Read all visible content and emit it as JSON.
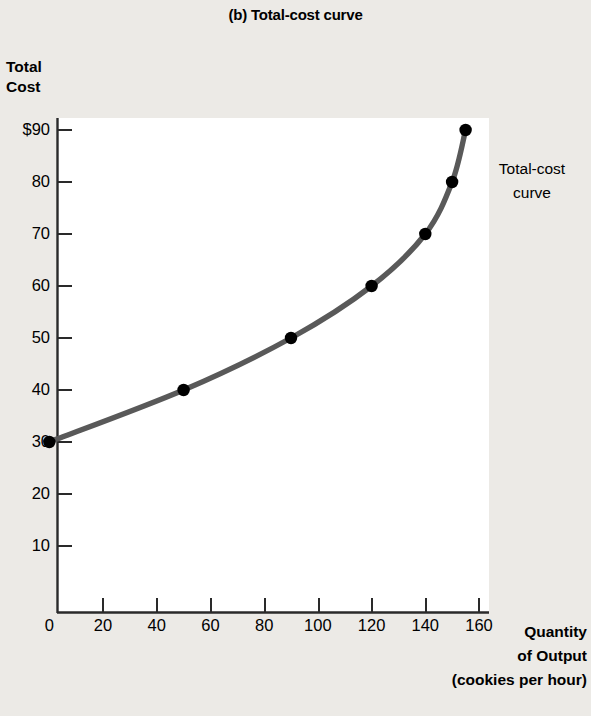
{
  "figure": {
    "panel_label": "(b)",
    "title": "(b) Total-cost curve",
    "background_color": "#eceae6",
    "plot_background_color": "#ffffff"
  },
  "chart_data": {
    "type": "line",
    "title": "(b) Total-cost curve",
    "xlabel": "Quantity of Output (cookies per hour)",
    "ylabel": "Total Cost",
    "xlim": [
      0,
      170
    ],
    "ylim": [
      0,
      93
    ],
    "grid": false,
    "legend": "none",
    "series": [
      {
        "name": "Total-cost curve",
        "color": "#595959",
        "marker": "circle",
        "marker_color": "#000000",
        "points": [
          {
            "x": 0,
            "y": 30
          },
          {
            "x": 50,
            "y": 40
          },
          {
            "x": 90,
            "y": 50
          },
          {
            "x": 120,
            "y": 60
          },
          {
            "x": 140,
            "y": 70
          },
          {
            "x": 150,
            "y": 80
          },
          {
            "x": 155,
            "y": 90
          }
        ],
        "x": [
          0,
          50,
          90,
          120,
          140,
          150,
          155
        ],
        "values": [
          30,
          40,
          50,
          60,
          70,
          80,
          90
        ]
      }
    ],
    "annotations": [
      {
        "text": "Total-cost curve",
        "x": 168,
        "y": 83
      }
    ],
    "xticks": [
      0,
      20,
      40,
      60,
      80,
      100,
      120,
      140,
      160
    ],
    "xtick_labels": [
      "0",
      "20",
      "40",
      "60",
      "80",
      "100",
      "120",
      "140",
      "160"
    ],
    "yticks": [
      10,
      20,
      30,
      40,
      50,
      60,
      70,
      80,
      90
    ],
    "ytick_labels": [
      "10",
      "20",
      "30",
      "40",
      "50",
      "60",
      "70",
      "80",
      "$90"
    ]
  },
  "y_axis": {
    "title_line1": "Total",
    "title_line2": "Cost",
    "ticks": [
      {
        "value": 90,
        "label": "$90"
      },
      {
        "value": 80,
        "label": "80"
      },
      {
        "value": 70,
        "label": "70"
      },
      {
        "value": 60,
        "label": "60"
      },
      {
        "value": 50,
        "label": "50"
      },
      {
        "value": 40,
        "label": "40"
      },
      {
        "value": 30,
        "label": "30"
      },
      {
        "value": 20,
        "label": "20"
      },
      {
        "value": 10,
        "label": "10"
      }
    ]
  },
  "x_axis": {
    "title_line1": "Quantity",
    "title_line2": "of Output",
    "title_line3": "(cookies per hour)",
    "ticks": [
      {
        "value": 0,
        "label": "0"
      },
      {
        "value": 20,
        "label": "20"
      },
      {
        "value": 40,
        "label": "40"
      },
      {
        "value": 60,
        "label": "60"
      },
      {
        "value": 80,
        "label": "80"
      },
      {
        "value": 100,
        "label": "100"
      },
      {
        "value": 120,
        "label": "120"
      },
      {
        "value": 140,
        "label": "140"
      },
      {
        "value": 160,
        "label": "160"
      }
    ]
  },
  "curve_annotation": {
    "line1": "Total-cost",
    "line2": "curve"
  }
}
